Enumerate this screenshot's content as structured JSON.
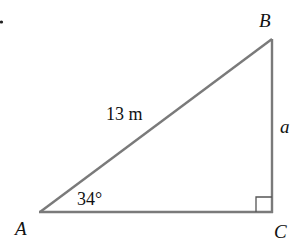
{
  "diagram": {
    "type": "right-triangle",
    "vertices": {
      "A": {
        "label": "A",
        "x": 40,
        "y": 212
      },
      "B": {
        "label": "B",
        "x": 272,
        "y": 39
      },
      "C": {
        "label": "C",
        "x": 272,
        "y": 212
      }
    },
    "labels": {
      "vertex_a": "A",
      "vertex_b": "B",
      "vertex_c": "C",
      "hypotenuse": "13 m",
      "side_bc": "a",
      "angle_a": "34°"
    },
    "right_angle_at": "C",
    "colors": {
      "stroke": "#777777",
      "text": "#111111",
      "background": "#ffffff"
    }
  }
}
